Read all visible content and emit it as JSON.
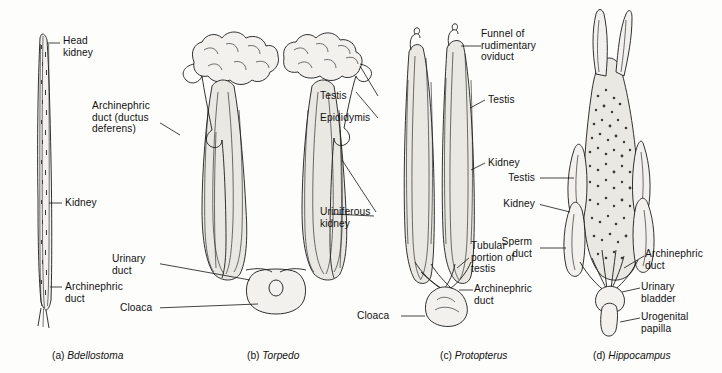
{
  "figure": {
    "background_color": "#fdfdfc",
    "ink_color": "#1b1b1b"
  },
  "panels": [
    {
      "id": "a",
      "caption_prefix": "(a)",
      "caption_taxon": "Bdellostoma",
      "labels": [
        {
          "name": "head-kidney",
          "text": "Head\nkidney"
        },
        {
          "name": "kidney",
          "text": "Kidney"
        },
        {
          "name": "archinephric-duct",
          "text": "Archinephric\nduct"
        }
      ]
    },
    {
      "id": "b",
      "caption_prefix": "(b)",
      "caption_taxon": "Torpedo",
      "labels": [
        {
          "name": "archinephric-duct-ductus-deferens",
          "text": "Archinephric\nduct (ductus\ndeferens)"
        },
        {
          "name": "testis",
          "text": "Testis"
        },
        {
          "name": "epididymis",
          "text": "Epididymis"
        },
        {
          "name": "uriniferous-kidney",
          "text": "Uriniferous\nkidney"
        },
        {
          "name": "urinary-duct",
          "text": "Urinary\nduct"
        },
        {
          "name": "cloaca",
          "text": "Cloaca"
        }
      ]
    },
    {
      "id": "c",
      "caption_prefix": "(c)",
      "caption_taxon": "Protopterus",
      "labels": [
        {
          "name": "funnel-of-rudimentary-oviduct",
          "text": "Funnel of\nrudimentary\noviduct"
        },
        {
          "name": "testis",
          "text": "Testis"
        },
        {
          "name": "kidney",
          "text": "Kidney"
        },
        {
          "name": "tubular-portion-of-testis",
          "text": "Tubular\nportion of\ntestis"
        },
        {
          "name": "archinephric-duct",
          "text": "Archinephric\nduct"
        },
        {
          "name": "cloaca",
          "text": "Cloaca"
        }
      ]
    },
    {
      "id": "d",
      "caption_prefix": "(d)",
      "caption_taxon": "Hippocampus",
      "labels": [
        {
          "name": "testis",
          "text": "Testis"
        },
        {
          "name": "kidney",
          "text": "Kidney"
        },
        {
          "name": "sperm-duct",
          "text": "Sperm\nduct"
        },
        {
          "name": "archinephric-duct",
          "text": "Archinephric\nduct"
        },
        {
          "name": "urinary-bladder",
          "text": "Urinary\nbladder"
        },
        {
          "name": "urogenital-papilla",
          "text": "Urogenital\npapilla"
        }
      ]
    }
  ]
}
